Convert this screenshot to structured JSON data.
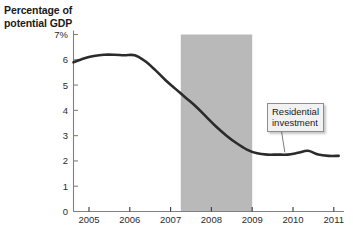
{
  "figure": {
    "axis_title": "Percentage of potential GDP",
    "axis_title_line1": "Percentage of",
    "axis_title_line2": "potential GDP",
    "annotation_label": "Residential investment",
    "annotation_line1": "Residential",
    "annotation_line2": "investment",
    "colors": {
      "line": "#2b2b2b",
      "recession_band": "#b9b9b9",
      "axis": "#808080",
      "text": "#1a1a1a",
      "background": "#ffffff",
      "annotation_fill": "#f2f2f2",
      "annotation_border": "#8d8d8d"
    }
  },
  "chart_data": {
    "type": "line",
    "title": "Percentage of potential GDP",
    "xlabel": "",
    "ylabel": "Percentage of potential GDP",
    "xlim": [
      2004.62,
      2011.25
    ],
    "ylim": [
      0,
      7
    ],
    "grid": false,
    "legend": "none",
    "x_ticks": [
      2005,
      2006,
      2007,
      2008,
      2009,
      2010,
      2011
    ],
    "x_tick_labels": [
      "2005",
      "2006",
      "2007",
      "2008",
      "2009",
      "2010",
      "2011"
    ],
    "y_ticks": [
      0,
      1,
      2,
      3,
      4,
      5,
      6,
      7
    ],
    "y_tick_labels": [
      "0",
      "1",
      "2",
      "3",
      "4",
      "5",
      "6",
      "7%"
    ],
    "series": [
      {
        "name": "Residential investment",
        "x": [
          2004.62,
          2004.87,
          2005.12,
          2005.37,
          2005.62,
          2005.87,
          2006.12,
          2006.37,
          2006.62,
          2006.87,
          2007.12,
          2007.37,
          2007.62,
          2007.87,
          2008.12,
          2008.37,
          2008.62,
          2008.87,
          2009.12,
          2009.37,
          2009.62,
          2009.87,
          2010.12,
          2010.37,
          2010.62,
          2010.87,
          2011.12
        ],
        "y": [
          5.9,
          6.05,
          6.15,
          6.2,
          6.2,
          6.18,
          6.18,
          5.95,
          5.6,
          5.2,
          4.85,
          4.5,
          4.15,
          3.75,
          3.35,
          3.0,
          2.7,
          2.45,
          2.3,
          2.25,
          2.25,
          2.25,
          2.32,
          2.4,
          2.25,
          2.2,
          2.2
        ]
      }
    ],
    "annotations": [
      {
        "text": "Residential investment",
        "points_to_x": 2009.8,
        "points_to_y": 2.3
      }
    ],
    "shaded_regions": [
      {
        "name": "recession",
        "x_start": 2007.25,
        "x_end": 2009.0,
        "color": "#b9b9b9"
      }
    ]
  }
}
